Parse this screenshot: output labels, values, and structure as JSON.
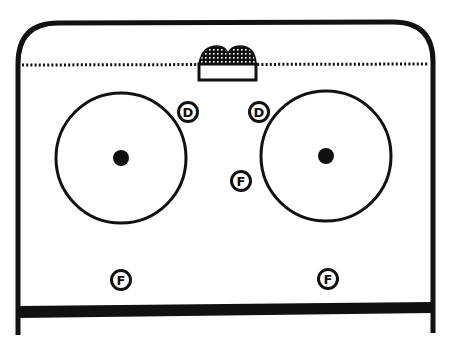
{
  "diagram": {
    "colors": {
      "ink": "#111111",
      "background": "#ffffff"
    },
    "zone": {
      "boundary": "rounded-corner boards",
      "goal_line": "dotted",
      "blue_line": "thick solid",
      "goal": "net"
    },
    "faceoff_circles": [
      {
        "id": "left",
        "has_center_dot": true
      },
      {
        "id": "right",
        "has_center_dot": true
      }
    ],
    "players": [
      {
        "id": "d-left",
        "label": "D",
        "role": "defenseman"
      },
      {
        "id": "d-right",
        "label": "D",
        "role": "defenseman"
      },
      {
        "id": "f-center",
        "label": "F",
        "role": "forward"
      },
      {
        "id": "f-bottom-left",
        "label": "F",
        "role": "forward"
      },
      {
        "id": "f-bottom-right",
        "label": "F",
        "role": "forward"
      }
    ]
  }
}
